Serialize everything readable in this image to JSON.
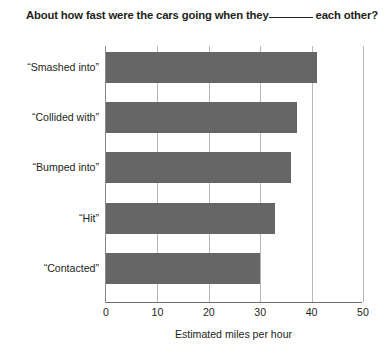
{
  "chart_data": {
    "type": "bar",
    "orientation": "horizontal",
    "title_parts": {
      "before_blank": "About how fast were the cars going when they",
      "blank": "______",
      "after_blank": "each other?"
    },
    "categories": [
      "“Smashed into”",
      "“Collided with”",
      "“Bumped into”",
      "“Hit”",
      "“Contacted”"
    ],
    "values": [
      41.0,
      37.2,
      35.9,
      32.8,
      30.0
    ],
    "xlabel": "Estimated miles per hour",
    "ylabel": "",
    "xlim": [
      0,
      50
    ],
    "xticks": [
      0,
      10,
      20,
      30,
      40,
      50
    ],
    "xtick_labels": [
      "0",
      "10",
      "20",
      "30",
      "40",
      "50"
    ],
    "grid": "vertical-only",
    "legend": "none",
    "bar_color": "#666666",
    "gridline_color": "#b8b8b8",
    "axis_color": "#6e6e6e",
    "text_color": "#231f20"
  }
}
